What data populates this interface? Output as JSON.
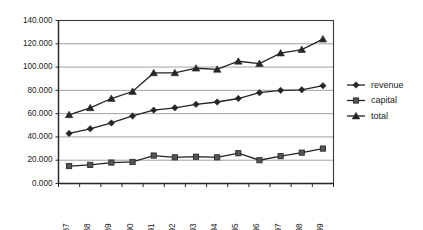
{
  "chart_data": {
    "type": "line",
    "title": "",
    "subtitle": "",
    "xlabel": "",
    "ylabel": "",
    "categories": [
      "1987",
      "1988",
      "1989",
      "1990",
      "1991",
      "1992",
      "1993",
      "1994",
      "1995",
      "1996",
      "1997",
      "1998",
      "1999"
    ],
    "series": [
      {
        "name": "revenue",
        "marker": "diamond",
        "values": [
          43.0,
          47.0,
          52.0,
          58.0,
          63.0,
          65.0,
          68.0,
          70.0,
          73.0,
          78.0,
          80.0,
          80.5,
          84.0
        ]
      },
      {
        "name": "capital",
        "marker": "square",
        "values": [
          15.0,
          16.0,
          18.0,
          18.5,
          24.0,
          22.5,
          23.0,
          22.5,
          26.0,
          20.0,
          23.5,
          26.5,
          30.0
        ]
      },
      {
        "name": "total",
        "marker": "triangle",
        "values": [
          59.0,
          65.0,
          73.0,
          79.0,
          95.0,
          95.0,
          99.0,
          98.0,
          105.0,
          103.0,
          112.0,
          115.0,
          124.0
        ]
      }
    ],
    "ylim": [
      0,
      140
    ],
    "ytick_values": [
      0,
      20,
      40,
      60,
      80,
      100,
      120,
      140
    ],
    "ytick_labels": [
      "0.000",
      "20.000",
      "40.000",
      "60.000",
      "80.000",
      "100.000",
      "120.000",
      "140.000"
    ],
    "grid": true,
    "grid_axis": "y",
    "legend_position": "right",
    "legend_entries": [
      "revenue",
      "capital",
      "total"
    ],
    "colors": {
      "series_line": "#222222",
      "grid": "#8c8c8c",
      "frame": "#3a3a3a",
      "text": "#1a1a1a",
      "capital_marker": "#555555"
    }
  }
}
